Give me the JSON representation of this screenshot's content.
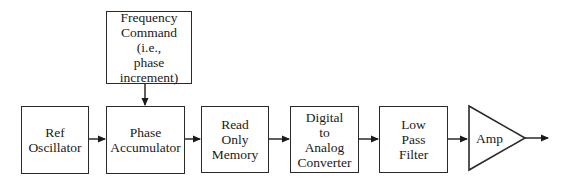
{
  "diagram": {
    "blocks": [
      {
        "id": "ref-oscillator",
        "lines": [
          "Ref",
          "Oscillator"
        ]
      },
      {
        "id": "phase-accumulator",
        "lines": [
          "Phase",
          "Accumulator"
        ]
      },
      {
        "id": "frequency-command",
        "lines": [
          "Frequency",
          "Command",
          "(i.e.,",
          "phase",
          "increment)"
        ]
      },
      {
        "id": "read-only-memory",
        "lines": [
          "Read",
          "Only",
          "Memory"
        ]
      },
      {
        "id": "dac",
        "lines": [
          "Digital",
          "to",
          "Analog",
          "Converter"
        ]
      },
      {
        "id": "low-pass-filter",
        "lines": [
          "Low",
          "Pass",
          "Filter"
        ]
      },
      {
        "id": "amp",
        "lines": [
          "Amp"
        ]
      }
    ],
    "connections": [
      {
        "from": "frequency-command",
        "to": "phase-accumulator"
      },
      {
        "from": "ref-oscillator",
        "to": "phase-accumulator"
      },
      {
        "from": "phase-accumulator",
        "to": "read-only-memory"
      },
      {
        "from": "read-only-memory",
        "to": "dac"
      },
      {
        "from": "dac",
        "to": "low-pass-filter"
      },
      {
        "from": "low-pass-filter",
        "to": "amp"
      },
      {
        "from": "amp",
        "to": "output"
      }
    ],
    "colors": {
      "stroke": "#2a2a2a",
      "background": "#ffffff"
    }
  }
}
